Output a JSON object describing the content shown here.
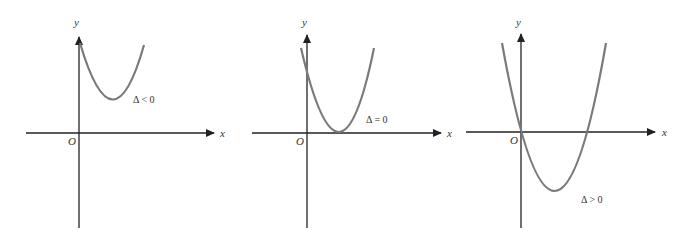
{
  "panels": [
    {
      "id": "delta-negative",
      "x_label": "x",
      "y_label": "y",
      "origin_label": "O",
      "delta_label": "Δ < 0",
      "description": "Upward parabola entirely above the x-axis (no real roots)"
    },
    {
      "id": "delta-zero",
      "x_label": "x",
      "y_label": "y",
      "origin_label": "O",
      "delta_label": "Δ = 0",
      "description": "Upward parabola tangent to the x-axis (one repeated root)"
    },
    {
      "id": "delta-positive",
      "x_label": "x",
      "y_label": "y",
      "origin_label": "O",
      "delta_label": "Δ > 0",
      "description": "Upward parabola crossing the x-axis twice (two real roots, one at origin)"
    }
  ],
  "colors": {
    "axis": "#222222",
    "curve": "#7a7a7a",
    "text": "#333333",
    "background": "#ffffff"
  }
}
